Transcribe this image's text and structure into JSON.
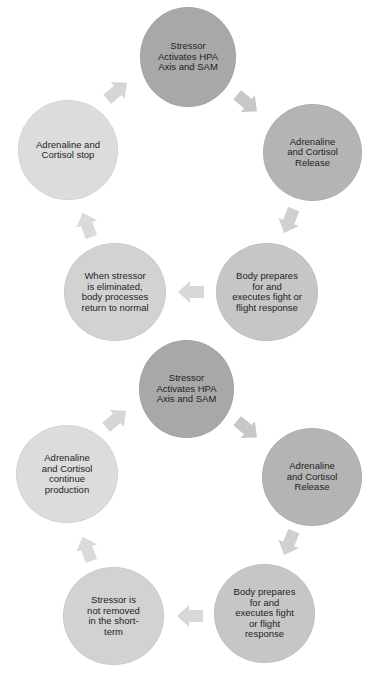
{
  "colors": {
    "node_dark": "#a8a8a8",
    "node_mid": "#c4c4c4",
    "node_light": "#d9d9d9",
    "arrow": "#d2d2d2",
    "text": "#1e1e1e"
  },
  "cycles": [
    {
      "name": "acute-stress-cycle",
      "nodes": [
        {
          "label": "Stressor Activates HPA Axis and SAM"
        },
        {
          "label": "Adrenaline and Cortisol Release"
        },
        {
          "label": "Body prepares for and executes fight or flight response"
        },
        {
          "label": "When stressor is eliminated, body processes return to normal"
        },
        {
          "label": "Adrenaline and Cortisol stop"
        }
      ]
    },
    {
      "name": "chronic-stress-cycle",
      "nodes": [
        {
          "label": "Stressor Activates HPA Axis and SAM"
        },
        {
          "label": "Adrenaline and Cortisol Release"
        },
        {
          "label": "Body prepares for and executes fight or flight response"
        },
        {
          "label": "Stressor is not removed in the short-term"
        },
        {
          "label": "Adrenaline and Cortisol continue production"
        }
      ]
    }
  ]
}
